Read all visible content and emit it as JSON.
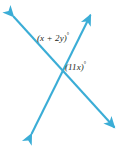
{
  "figure": {
    "kind": "geometry-diagram",
    "width": 123,
    "height": 146,
    "background_color": "#ffffff",
    "line_color": "#3badd6",
    "text_color": "#231f20",
    "stroke_width": 2.1,
    "intersection": {
      "x": 60,
      "y": 68
    },
    "lines": [
      {
        "name": "line-bl-tr",
        "from": {
          "x": 30,
          "y": 137
        },
        "to": {
          "x": 92,
          "y": 12
        },
        "arrow_start": true,
        "arrow_end": true
      },
      {
        "name": "line-tl-br",
        "from": {
          "x": 11,
          "y": 14
        },
        "to": {
          "x": 117,
          "y": 130
        },
        "arrow_start": true,
        "arrow_end": true
      }
    ],
    "labels": [
      {
        "name": "angle-label-x-plus-2y",
        "expression": "(x + 2y)",
        "degree_symbol": "°",
        "x": 37,
        "y": 34
      },
      {
        "name": "angle-label-11x",
        "expression": "(11x)",
        "degree_symbol": "°",
        "x": 65,
        "y": 63
      }
    ]
  }
}
